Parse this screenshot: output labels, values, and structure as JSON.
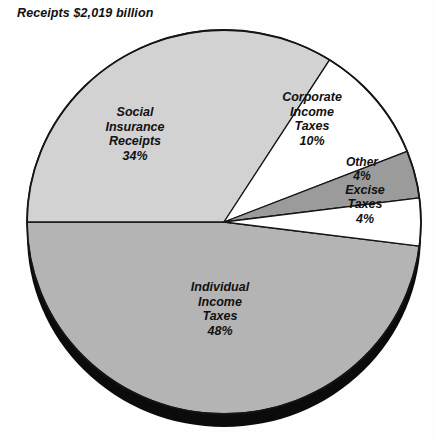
{
  "title": "Receipts $2,019 billion",
  "chart_data": {
    "type": "pie",
    "title": "Receipts $2,019 billion",
    "total_label": "$2,019 billion",
    "unit": "percent",
    "grid": false,
    "legend": "none",
    "labels_inside_slices": true,
    "start_angle_deg": 180,
    "direction": "counterclockwise-from-left",
    "categories": [
      "Individual Income Taxes",
      "Social Insurance Receipts",
      "Corporate Income Taxes",
      "Other",
      "Excise Taxes"
    ],
    "values": [
      48,
      34,
      10,
      4,
      4
    ],
    "slices": [
      {
        "name": "Individual Income Taxes",
        "label_lines": [
          "Individual",
          "Income",
          "Taxes",
          "48%"
        ],
        "value": 48,
        "value_label": "48%",
        "color": "#b4b4b4",
        "start_deg": 180,
        "end_deg": 352.8,
        "label_x": 220,
        "label_y": 310
      },
      {
        "name": "Social Insurance Receipts",
        "label_lines": [
          "Social",
          "Insurance",
          "Receipts",
          "34%"
        ],
        "value": 34,
        "value_label": "34%",
        "color": "#d2d2d2",
        "start_deg": 57.6,
        "end_deg": 180,
        "label_x": 135,
        "label_y": 135
      },
      {
        "name": "Corporate Income Taxes",
        "label_lines": [
          "Corporate",
          "Income",
          "Taxes",
          "10%"
        ],
        "value": 10,
        "value_label": "10%",
        "color": "#ffffff",
        "start_deg": 21.6,
        "end_deg": 57.6,
        "label_x": 312,
        "label_y": 120
      },
      {
        "name": "Other",
        "label_lines": [
          "Other",
          "4%"
        ],
        "value": 4,
        "value_label": "4%",
        "color": "#9b9b9b",
        "start_deg": 7.2,
        "end_deg": 21.6,
        "label_x": 362,
        "label_y": 170
      },
      {
        "name": "Excise Taxes",
        "label_lines": [
          "Excise",
          "Taxes",
          "4%"
        ],
        "value": 4,
        "value_label": "4%",
        "color": "#ffffff",
        "start_deg": 352.8,
        "end_deg": 7.2,
        "label_x": 365,
        "label_y": 205
      }
    ],
    "geometry": {
      "center_x": 224,
      "center_y": 222,
      "radius_x": 197,
      "radius_y": 192,
      "depth_px": 13,
      "depth_color": "#0b0b0b",
      "outline_color": "#151515"
    }
  }
}
